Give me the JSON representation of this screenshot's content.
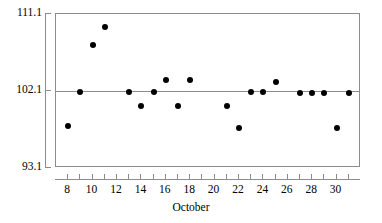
{
  "chart_data": {
    "type": "scatter",
    "title": "",
    "subtitle": "",
    "xlabel": "October",
    "ylabel": "",
    "xlim": [
      7,
      32
    ],
    "ylim": [
      93.1,
      111.1
    ],
    "grid": false,
    "legend": null,
    "y_ticks": [
      93.1,
      102.1,
      111.1
    ],
    "y_tick_labels": [
      "93.1",
      "102.1",
      "111.1"
    ],
    "x_ticks": [
      8,
      9,
      10,
      11,
      12,
      13,
      14,
      15,
      16,
      17,
      18,
      19,
      20,
      21,
      22,
      23,
      24,
      25,
      26,
      27,
      28,
      29,
      30,
      31
    ],
    "x_tick_labels": [
      "8",
      "10",
      "12",
      "14",
      "16",
      "18",
      "20",
      "22",
      "24",
      "26",
      "28",
      "30"
    ],
    "x_labeled_ticks": [
      8,
      10,
      12,
      14,
      16,
      18,
      20,
      22,
      24,
      26,
      28,
      30
    ],
    "reference_line": {
      "orientation": "horizontal",
      "value": 102.1,
      "label": "center-line"
    },
    "marker": {
      "shape": "circle",
      "filled": true,
      "color": "#000000",
      "size_px": 6
    },
    "series": [
      {
        "name": "measurement",
        "x": [
          8,
          9,
          10,
          11,
          13,
          14,
          15,
          16,
          17,
          18,
          21,
          22,
          23,
          24,
          25,
          27,
          28,
          29,
          30,
          31
        ],
        "y": [
          98.0,
          102.0,
          107.5,
          109.6,
          102.0,
          100.4,
          102.0,
          103.4,
          100.4,
          103.4,
          100.4,
          97.8,
          102.0,
          102.0,
          103.2,
          101.9,
          101.9,
          101.9,
          97.8,
          101.9
        ],
        "points": [
          {
            "x": 8,
            "y": 98.0
          },
          {
            "x": 9,
            "y": 102.0
          },
          {
            "x": 10,
            "y": 107.5
          },
          {
            "x": 11,
            "y": 109.6
          },
          {
            "x": 13,
            "y": 102.0
          },
          {
            "x": 14,
            "y": 100.4
          },
          {
            "x": 15,
            "y": 102.0
          },
          {
            "x": 16,
            "y": 103.4
          },
          {
            "x": 17,
            "y": 100.4
          },
          {
            "x": 18,
            "y": 103.4
          },
          {
            "x": 21,
            "y": 100.4
          },
          {
            "x": 22,
            "y": 97.8
          },
          {
            "x": 23,
            "y": 102.0
          },
          {
            "x": 24,
            "y": 102.0
          },
          {
            "x": 25,
            "y": 103.2
          },
          {
            "x": 27,
            "y": 101.9
          },
          {
            "x": 28,
            "y": 101.9
          },
          {
            "x": 29,
            "y": 101.9
          },
          {
            "x": 30,
            "y": 97.8
          },
          {
            "x": 31,
            "y": 101.9
          }
        ]
      }
    ]
  },
  "colors": {
    "axis": "#8c8c8c",
    "marker": "#000000",
    "background": "#ffffff",
    "text": "#000000"
  }
}
